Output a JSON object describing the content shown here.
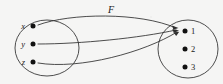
{
  "figure": {
    "kind": "function-arrow-diagram",
    "map_label": "F"
  },
  "domain": {
    "name": "domain-oval",
    "elements": [
      {
        "label": "x",
        "dot_x": 33,
        "dot_y": 26,
        "label_x": 25,
        "label_y": 29
      },
      {
        "label": "y",
        "dot_x": 33,
        "dot_y": 44,
        "label_x": 25,
        "label_y": 47
      },
      {
        "label": "z",
        "dot_x": 33,
        "dot_y": 62,
        "label_x": 25,
        "label_y": 65
      }
    ],
    "oval": {
      "cx": 47,
      "cy": 48,
      "rx": 32,
      "ry": 28
    }
  },
  "codomain": {
    "name": "codomain-oval",
    "elements": [
      {
        "label": "1",
        "dot_x": 185,
        "dot_y": 31,
        "label_x": 191,
        "label_y": 34
      },
      {
        "label": "2",
        "dot_x": 185,
        "dot_y": 49,
        "label_x": 191,
        "label_y": 52
      },
      {
        "label": "3",
        "dot_x": 185,
        "dot_y": 67,
        "label_x": 191,
        "label_y": 70
      }
    ],
    "oval": {
      "cx": 188,
      "cy": 49,
      "rx": 30,
      "ry": 29
    }
  },
  "mappings": [
    {
      "from": "x",
      "to": "1",
      "path": "M 38 25 C 70 13, 140 12, 176 28"
    },
    {
      "from": "y",
      "to": "1",
      "path": "M 38 44 C 80 44, 140 38, 176 30"
    },
    {
      "from": "z",
      "to": "1",
      "path": "M 38 63 C 80 70, 145 52, 177 32"
    }
  ],
  "colors": {
    "background": "#fbfbfa",
    "stroke": "#2e2e2e",
    "oval_stroke": "#3a3a3a",
    "dot": "#111111",
    "text": "#1a1a1a"
  },
  "canvas": {
    "width": 223,
    "height": 84
  }
}
